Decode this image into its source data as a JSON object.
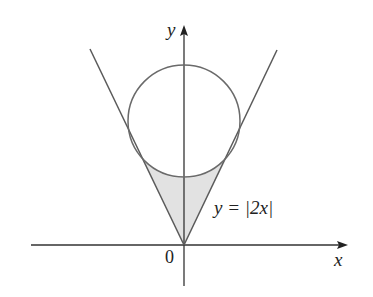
{
  "figure": {
    "type": "geometry-diagram"
  },
  "labels": {
    "y_axis": "y",
    "x_axis": "x",
    "origin": "0",
    "curve_equation": "y = |2x|"
  },
  "colors": {
    "axis": "#333333",
    "lines": "#5a5a5a",
    "circle": "#6a6a6a",
    "shading": "#e2e2e2",
    "background": "#ffffff"
  },
  "geometry": {
    "origin_px": [
      184,
      245
    ],
    "x_axis_px": {
      "start": [
        31,
        245
      ],
      "end": [
        348,
        245
      ]
    },
    "y_axis_px": {
      "start": [
        184,
        286
      ],
      "end": [
        184,
        25
      ]
    },
    "left_line_px": {
      "from": [
        184,
        245
      ],
      "to": [
        90,
        49
      ]
    },
    "right_line_px": {
      "from": [
        184,
        245
      ],
      "to": [
        277,
        50
      ]
    },
    "circle_px": {
      "cx": 184,
      "cy": 121,
      "r": 56
    },
    "tangent_points_px": [
      [
        142,
        159
      ],
      [
        226,
        159
      ]
    ],
    "shaded_region": "between lines y=|2x| and lower arc of circle, above vertex at origin"
  }
}
